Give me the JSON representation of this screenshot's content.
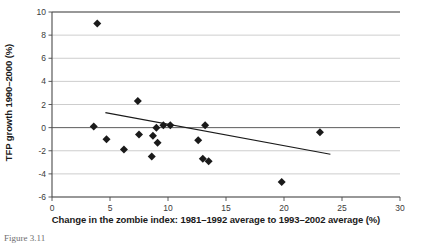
{
  "chart_data": {
    "type": "scatter",
    "title": "",
    "xlabel": "Change in the zombie index: 1981–1992 average to 1993–2002 average (%)",
    "ylabel": "TFP growth 1990–2000 (%)",
    "xlim": [
      0,
      30
    ],
    "ylim": [
      -6,
      10
    ],
    "xticks": [
      0,
      5,
      10,
      15,
      20,
      25,
      30
    ],
    "yticks": [
      -6,
      -4,
      -2,
      0,
      2,
      4,
      6,
      8,
      10
    ],
    "xtick_labels": [
      "0",
      "5",
      "10",
      "15",
      "20",
      "25",
      "30"
    ],
    "ytick_labels": [
      "-6",
      "-4",
      "-2",
      "0",
      "2",
      "4",
      "6",
      "8",
      "10"
    ],
    "grid": true,
    "legend": false,
    "marker": "diamond",
    "marker_color": "#1a1a1a",
    "trendline_color": "#1a1a1a",
    "points": [
      {
        "x": 3.9,
        "y": 9.0
      },
      {
        "x": 7.4,
        "y": 2.3
      },
      {
        "x": 3.6,
        "y": 0.1
      },
      {
        "x": 4.7,
        "y": -1.0
      },
      {
        "x": 6.2,
        "y": -1.9
      },
      {
        "x": 7.5,
        "y": -0.6
      },
      {
        "x": 9.0,
        "y": 0.0
      },
      {
        "x": 8.7,
        "y": -0.7
      },
      {
        "x": 9.6,
        "y": 0.2
      },
      {
        "x": 10.2,
        "y": 0.2
      },
      {
        "x": 9.1,
        "y": -1.3
      },
      {
        "x": 8.6,
        "y": -2.5
      },
      {
        "x": 12.6,
        "y": -1.1
      },
      {
        "x": 13.0,
        "y": -2.7
      },
      {
        "x": 13.5,
        "y": -2.9
      },
      {
        "x": 13.2,
        "y": 0.2
      },
      {
        "x": 19.8,
        "y": -4.7
      },
      {
        "x": 23.1,
        "y": -0.4
      }
    ],
    "trendline": {
      "x0": 4.6,
      "y0": 1.3,
      "x1": 24.0,
      "y1": -2.3
    },
    "caption": "Figure 3.11"
  }
}
